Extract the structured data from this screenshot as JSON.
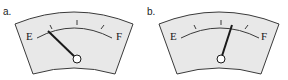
{
  "gauges": [
    {
      "label": "a.",
      "empty_label": "E",
      "full_label": "F",
      "needle_fraction": 0.12,
      "needle_description": "near empty"
    },
    {
      "label": "b.",
      "empty_label": "E",
      "full_label": "F",
      "needle_fraction": 0.6,
      "needle_description": "a little past half"
    }
  ],
  "colors": {
    "face": "#e8e8e8",
    "outline": "#3a3a3a",
    "needle": "#1a1a1a",
    "pivot_fill": "#ffffff"
  }
}
